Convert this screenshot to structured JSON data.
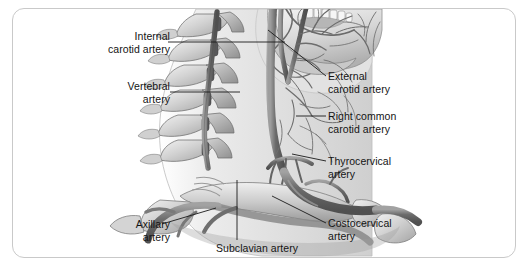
{
  "figure": {
    "kind": "anatomical-illustration",
    "panel_border_color": "#c9c9c9",
    "background_color": "#ffffff",
    "illustration_palette": {
      "bone_light": "#e7e7e7",
      "bone_mid": "#c2c2c2",
      "bone_shadow": "#9a9a9a",
      "artery_dark": "#6f6f6f",
      "artery_mid": "#8d8d8d",
      "soft_tissue": "#d9d9d9",
      "outline": "#5a5a5a"
    }
  },
  "labels": {
    "internal_carotid": "Internal\ncarotid artery",
    "vertebral": "Vertebral\nartery",
    "axillary": "Axillary\nartery",
    "external_carotid": "External\ncarotid artery",
    "right_common_carotid": "Right common\ncarotid artery",
    "thyrocervical": "Thyrocervical\nartery",
    "costocervical": "Costocervical\nartery",
    "subclavian": "Subclavian artery"
  }
}
